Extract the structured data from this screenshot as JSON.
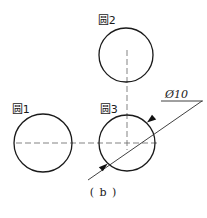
{
  "figure": {
    "caption": "( b )",
    "background_color": "#ffffff",
    "line_color": "#1a1a1a",
    "centerline_color": "#6e6e6e"
  },
  "circles": [
    {
      "id": "circle-1",
      "label": "圆1",
      "cx": 43,
      "cy": 143,
      "r": 29
    },
    {
      "id": "circle-2",
      "label": "圆2",
      "cx": 126,
      "cy": 55,
      "r": 27
    },
    {
      "id": "circle-3",
      "label": "圆3",
      "cx": 127,
      "cy": 143,
      "r": 28
    }
  ],
  "dimension": {
    "text": "Ø10",
    "symbol": "diameter-symbol",
    "value": "10",
    "applies_to": "circle-3",
    "leader_start_x": 148,
    "leader_start_y": 122,
    "leader_end_x": 202,
    "leader_end_y": 101
  },
  "centerlines": {
    "horizontal": {
      "x1": 16,
      "y1": 143,
      "x2": 160,
      "y2": 143
    },
    "vertical": {
      "x1": 127,
      "y1": 50,
      "x2": 127,
      "y2": 150
    }
  }
}
